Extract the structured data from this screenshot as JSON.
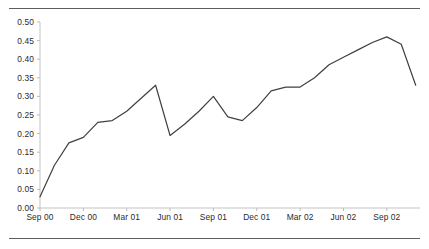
{
  "chart_data": {
    "type": "line",
    "title": "",
    "subtitle": "",
    "xlabel": "",
    "ylabel": "",
    "ylim": [
      0.0,
      0.5
    ],
    "grid": false,
    "legend": "none",
    "y_ticks": [
      "0.00",
      "0.05",
      "0.10",
      "0.15",
      "0.20",
      "0.25",
      "0.30",
      "0.35",
      "0.40",
      "0.45",
      "0.50"
    ],
    "y_tick_values": [
      0.0,
      0.05,
      0.1,
      0.15,
      0.2,
      0.25,
      0.3,
      0.35,
      0.4,
      0.45,
      0.5
    ],
    "x_ticks": [
      "Sep 00",
      "Dec 00",
      "Mar 01",
      "Jun 01",
      "Sep 01",
      "Dec 01",
      "Mar 02",
      "Jun 02",
      "Sep 02"
    ],
    "x_tick_positions": [
      0,
      3,
      6,
      9,
      12,
      15,
      18,
      21,
      24
    ],
    "x": [
      0,
      1,
      2,
      3,
      4,
      5,
      6,
      7,
      8,
      9,
      10,
      11,
      12,
      13,
      14,
      15,
      16,
      17,
      18,
      19,
      20,
      21,
      22,
      23,
      24,
      25,
      26
    ],
    "x_labels": [
      "Sep 00",
      "Oct 00",
      "Nov 00",
      "Dec 00",
      "Jan 01",
      "Feb 01",
      "Mar 01",
      "Apr 01",
      "May 01",
      "Jun 01",
      "Jul 01",
      "Aug 01",
      "Sep 01",
      "Oct 01",
      "Nov 01",
      "Dec 01",
      "Jan 02",
      "Feb 02",
      "Mar 02",
      "Apr 02",
      "May 02",
      "Jun 02",
      "Jul 02",
      "Aug 02",
      "Sep 02",
      "Oct 02",
      "Nov 02"
    ],
    "values": [
      0.03,
      0.115,
      0.175,
      0.19,
      0.23,
      0.235,
      0.26,
      0.295,
      0.33,
      0.195,
      0.225,
      0.26,
      0.3,
      0.245,
      0.235,
      0.27,
      0.315,
      0.325,
      0.325,
      0.35,
      0.385,
      0.405,
      0.425,
      0.445,
      0.46,
      0.44,
      0.33
    ],
    "series_name": "",
    "line_color": "#404040",
    "axis_color": "#b9b9b9",
    "rule_color": "#5d5d5d",
    "text_color": "#2b2b2b"
  }
}
